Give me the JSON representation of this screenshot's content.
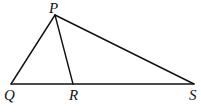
{
  "diagram": {
    "type": "triangle",
    "points": {
      "P": {
        "label": "P",
        "x": 55,
        "y": 15
      },
      "Q": {
        "label": "Q",
        "x": 11,
        "y": 84
      },
      "R": {
        "label": "R",
        "x": 73,
        "y": 84
      },
      "S": {
        "label": "S",
        "x": 194,
        "y": 84
      }
    },
    "segments": [
      "PQ",
      "PR",
      "PS",
      "QS"
    ],
    "colors": {
      "stroke": "#111111",
      "background": "#ffffff"
    }
  }
}
